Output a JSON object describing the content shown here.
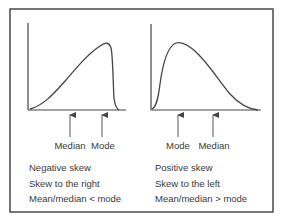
{
  "colors": {
    "line": "#444444",
    "frame": "#3c3c3c",
    "text": "#3a3a3a",
    "background": "#ffffff"
  },
  "left_panel": {
    "curve_description": "negatively skewed distribution",
    "markers": [
      {
        "label": "Median"
      },
      {
        "label": "Mode"
      }
    ],
    "caption": [
      "Negative skew",
      "Skew to the right",
      "Mean/median < mode"
    ]
  },
  "right_panel": {
    "curve_description": "positively skewed distribution",
    "markers": [
      {
        "label": "Mode"
      },
      {
        "label": "Median"
      }
    ],
    "caption": [
      "Positive skew",
      "Skew to the left",
      "Mean/median > mode"
    ]
  }
}
